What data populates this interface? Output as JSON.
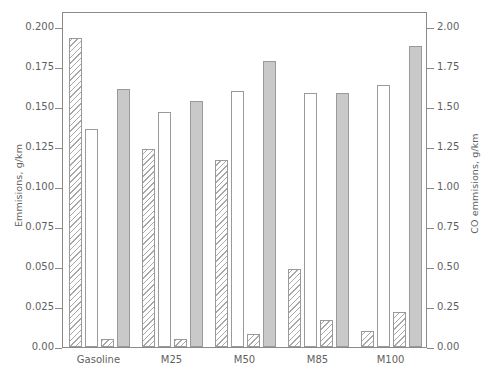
{
  "chart_data": {
    "type": "bar",
    "title": "",
    "subtitle": "",
    "xlabel": "",
    "ylabel": "Emmisions, g/km",
    "y2label": "CO emmisions, g/km",
    "categories": [
      "Gasoline",
      "M25",
      "M50",
      "M85",
      "M100"
    ],
    "ylim": [
      0.0,
      0.21
    ],
    "y2lim": [
      0.0,
      2.1
    ],
    "grid": false,
    "legend": "none",
    "yticks": [
      "0.00",
      "0.025",
      "0.050",
      "0.075",
      "0.100",
      "0.125",
      "0.150",
      "0.175",
      "0.200"
    ],
    "ytick_values": [
      0.0,
      0.025,
      0.05,
      0.075,
      0.1,
      0.125,
      0.15,
      0.175,
      0.2
    ],
    "y2ticks": [
      "0.00",
      "0.25",
      "0.50",
      "0.75",
      "1.00",
      "1.25",
      "1.50",
      "1.75",
      "2.00"
    ],
    "y2tick_values": [
      0.0,
      0.25,
      0.5,
      0.75,
      1.0,
      1.25,
      1.5,
      1.75,
      2.0
    ],
    "series": [
      {
        "name": "hatched-series-1",
        "style": "hatch",
        "axis": "left",
        "values": [
          0.193,
          0.124,
          0.117,
          0.049,
          0.01
        ]
      },
      {
        "name": "open-series",
        "style": "open",
        "axis": "left",
        "values": [
          0.136,
          0.147,
          0.16,
          0.159,
          0.164
        ]
      },
      {
        "name": "hatched-series-2",
        "style": "hatch",
        "axis": "left",
        "values": [
          0.005,
          0.005,
          0.008,
          0.017,
          0.022
        ]
      },
      {
        "name": "co-series",
        "style": "solid",
        "axis": "right",
        "values": [
          1.61,
          1.54,
          1.79,
          1.59,
          1.88
        ]
      }
    ],
    "colors": {
      "solid_fill": "#c9c9c9",
      "open_fill": "#ffffff",
      "hatch_line": "#a8a8a8",
      "border": "#9a9a9a",
      "axis": "#8a8a8a",
      "text": "#5f5f5f"
    }
  }
}
